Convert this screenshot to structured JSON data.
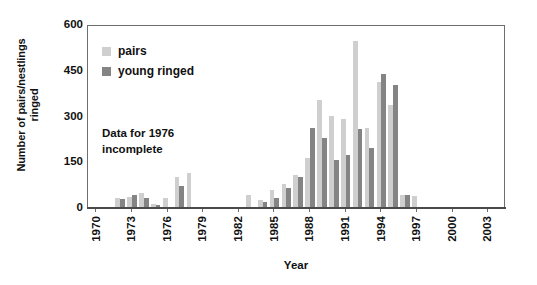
{
  "chart_data": {
    "type": "bar",
    "title": "",
    "xlabel": "Year",
    "ylabel": "Number of pairs/nestlings ringed",
    "ylabel_line1": "Number of pairs/nestlings",
    "ylabel_line2": "ringed",
    "ylim": [
      0,
      600
    ],
    "yticks": [
      600,
      450,
      300,
      150,
      0
    ],
    "ytick_labels": [
      "600",
      "450",
      "300",
      "150",
      "0"
    ],
    "xlim": [
      1969.3,
      2004.5
    ],
    "xticks": [
      1970,
      1973,
      1976,
      1979,
      1982,
      1985,
      1988,
      1991,
      1994,
      1997,
      2000,
      2003
    ],
    "xtick_labels": [
      "1970",
      "1973",
      "1976",
      "1979",
      "1982",
      "1985",
      "1988",
      "1991",
      "1994",
      "1997",
      "2000",
      "2003"
    ],
    "grid": false,
    "legend_position": "upper-left-inside",
    "annotation": "Data for 1976 incomplete",
    "annotation_line1": "Data for 1976",
    "annotation_line2": "incomplete",
    "colors": {
      "pairs": "#cfcfcf",
      "young_ringed": "#848484",
      "axis": "#6e6e6e",
      "text": "#111111",
      "background": "#ffffff"
    },
    "x": [
      1972,
      1973,
      1974,
      1975,
      1976,
      1977,
      1978,
      1983,
      1984,
      1985,
      1986,
      1987,
      1988,
      1989,
      1990,
      1991,
      1992,
      1993,
      1994,
      1995,
      1996,
      1997
    ],
    "series": [
      {
        "name": "pairs",
        "color": "#cfcfcf",
        "values": [
          30,
          32,
          45,
          10,
          30,
          100,
          110,
          40,
          22,
          55,
          75,
          105,
          160,
          350,
          300,
          290,
          545,
          260,
          410,
          335,
          40,
          35
        ]
      },
      {
        "name": "young ringed",
        "color": "#848484",
        "values": [
          25,
          40,
          30,
          8,
          0,
          68,
          0,
          0,
          15,
          28,
          62,
          98,
          260,
          225,
          155,
          170,
          255,
          195,
          435,
          400,
          40,
          0
        ]
      }
    ]
  },
  "legend": {
    "items": [
      {
        "label": "pairs",
        "key": "pairs"
      },
      {
        "label": "young ringed",
        "key": "young"
      }
    ]
  }
}
